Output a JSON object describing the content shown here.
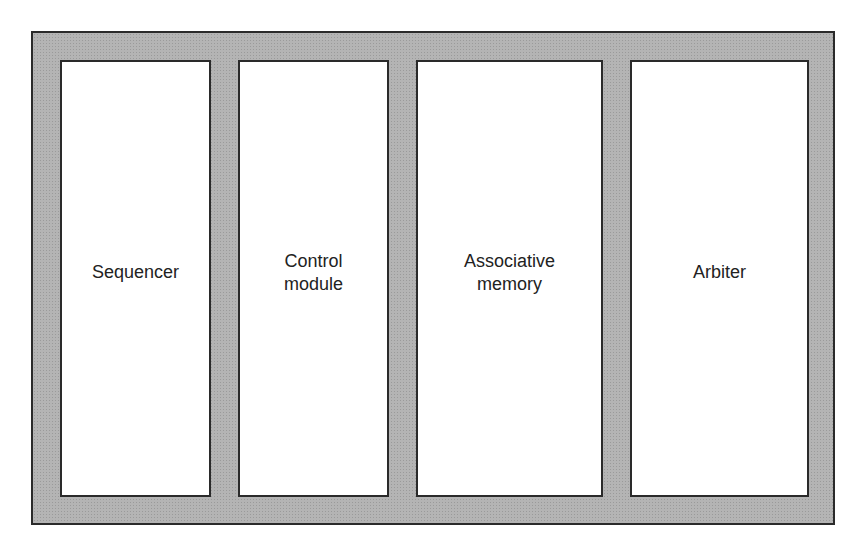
{
  "diagram": {
    "type": "block-diagram",
    "colors": {
      "frame_fill": "#b4b4b4",
      "border": "#2a2a2a",
      "box_fill": "#ffffff"
    },
    "blocks": [
      {
        "label": "Sequencer"
      },
      {
        "label": "Control\nmodule"
      },
      {
        "label": "Associative\nmemory"
      },
      {
        "label": "Arbiter"
      }
    ]
  }
}
